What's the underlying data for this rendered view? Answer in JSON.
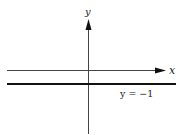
{
  "diagram": {
    "axes": {
      "x_label": "x",
      "y_label": "y"
    },
    "line": {
      "equation_label": "y = −1",
      "y_value": -1
    },
    "colors": {
      "axis": "#333333",
      "line": "#111111",
      "background": "#ffffff"
    }
  }
}
